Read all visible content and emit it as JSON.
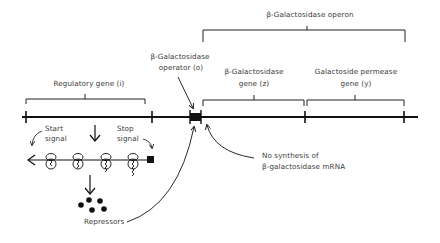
{
  "diagram": {
    "labels": {
      "operon": "β-Galactosidase operon",
      "operator_line1": "β-Galactosidase",
      "operator_line2": "operator (o)",
      "regulatory_gene": "Regulatory gene (i)",
      "z_gene_line1": "β-Galactosidase",
      "z_gene_line2": "gene (z)",
      "y_gene_line1": "Galactoside permease",
      "y_gene_line2": "gene (y)",
      "start_line1": "Start",
      "start_line2": "signal",
      "stop_line1": "Stop",
      "stop_line2": "signal",
      "no_synthesis_line1": "No synthesis of",
      "no_synthesis_line2": "β-galactosidase mRNA",
      "repressors": "Repressors"
    },
    "colors": {
      "ink": "#111111",
      "text": "#3a3a3a",
      "background": "#ffffff"
    },
    "dna": {
      "segments": [
        "regulatory gene (i)",
        "operator (o)",
        "β-galactosidase gene (z)",
        "galactoside permease gene (y)"
      ],
      "tick_positions_px": [
        25,
        152,
        196,
        302,
        405
      ]
    },
    "ribosome_count": 4,
    "repressor_count": 6
  }
}
